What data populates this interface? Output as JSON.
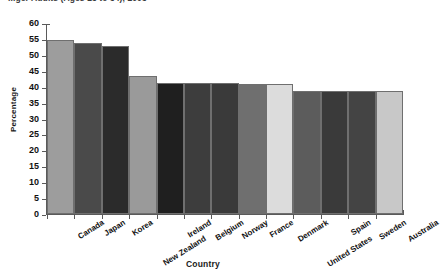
{
  "chart_data": {
    "type": "bar",
    "title": "...ger Adults (Ages 25 to 34), 2005",
    "xlabel": "Country",
    "ylabel": "Percentage",
    "ylim": [
      0,
      60
    ],
    "ytick_step": 5,
    "yticks": [
      "60",
      "55",
      "50",
      "45",
      "40",
      "35",
      "30",
      "25",
      "20",
      "15",
      "10",
      "5",
      "0"
    ],
    "grid": false,
    "legend": "none",
    "categories": [
      "Canada",
      "Japan",
      "Korea",
      "New Zealand",
      "Ireland",
      "Belgium",
      "Norway",
      "France",
      "Denmark",
      "United States",
      "Spain",
      "Sweden",
      "Australia"
    ],
    "values": [
      54.8,
      54,
      53,
      43.5,
      41.5,
      41.5,
      41.5,
      41,
      41,
      39,
      39,
      39,
      39
    ],
    "bar_colors": [
      "#9d9d9d",
      "#4a4a4a",
      "#2b2b2b",
      "#9a9a9a",
      "#1f1f1f",
      "#3d3d3d",
      "#3a3a3a",
      "#6f6f6f",
      "#dcdcdc",
      "#5c5c5c",
      "#3a3a3a",
      "#444444",
      "#c8c8c8"
    ],
    "bar_border_color": "#6f6f6f",
    "axis_color": "#5a5a5a",
    "background": "#ffffff"
  }
}
